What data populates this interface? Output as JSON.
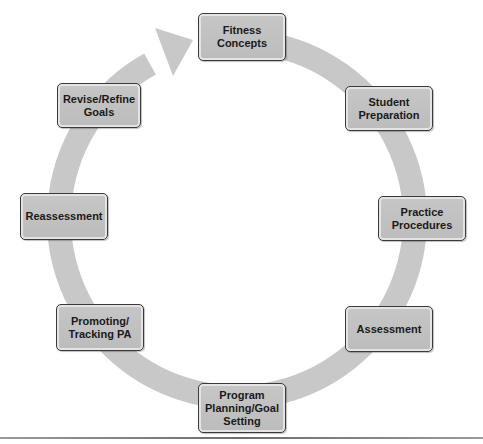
{
  "diagram": {
    "type": "cycle",
    "ring_color": "#c8c8c8",
    "box_color": "#c2c2c2",
    "box_border_color": "#3a3a3a",
    "text_color": "#1a1a1a",
    "nodes": [
      {
        "id": "fitness-concepts",
        "label": "Fitness\nConcepts"
      },
      {
        "id": "student-preparation",
        "label": "Student\nPreparation"
      },
      {
        "id": "practice-procedures",
        "label": "Practice\nProcedures"
      },
      {
        "id": "assessment",
        "label": "Assessment"
      },
      {
        "id": "program-planning",
        "label": "Program\nPlanning/Goal\nSetting"
      },
      {
        "id": "promoting-tracking",
        "label": "Promoting/\nTracking PA"
      },
      {
        "id": "reassessment",
        "label": "Reassessment"
      },
      {
        "id": "revise-refine",
        "label": "Revise/Refine\nGoals"
      }
    ],
    "flow": "clockwise",
    "arrow": {
      "from": "revise-refine",
      "to": "fitness-concepts"
    }
  }
}
